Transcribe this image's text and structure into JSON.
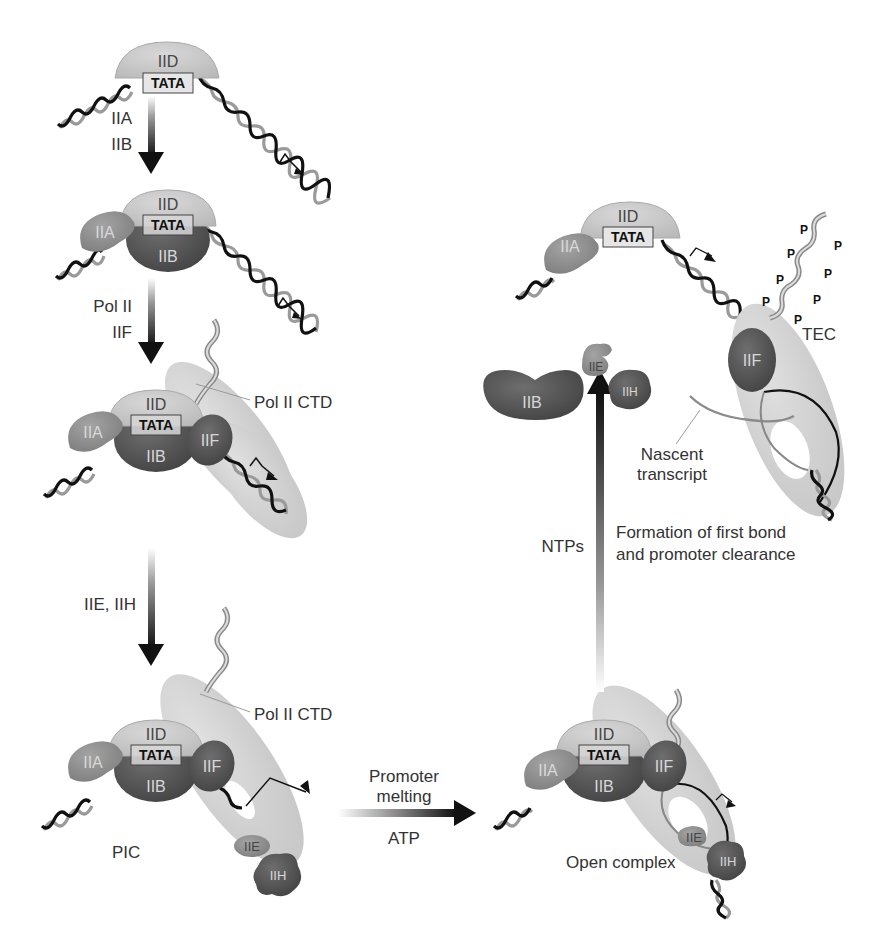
{
  "colors": {
    "iid": "#c9c9c9",
    "iia": "#8f8f8f",
    "iib": "#5a5a5a",
    "iif": "#5e5e5e",
    "iie": "#a8a8a8",
    "iih": "#555555",
    "polII": "#d4d4d4",
    "arrow": "#1a1a1a"
  },
  "factors": {
    "iid": "IID",
    "iia": "IIA",
    "iib": "IIB",
    "iif": "IIF",
    "iie": "IIE",
    "iih": "IIH",
    "tata": "TATA"
  },
  "steps": [
    {
      "id": "tfiid-bound",
      "arrow_labels": [
        "IIA",
        "IIB"
      ]
    },
    {
      "id": "iia-iib-bound",
      "arrow_labels": [
        "Pol II",
        "IIF"
      ]
    },
    {
      "id": "pol-ii-recruited",
      "arrow_labels": [
        "IIE, IIH"
      ],
      "callout": "Pol II CTD"
    },
    {
      "id": "pic",
      "label": "PIC",
      "callout": "Pol II CTD"
    },
    {
      "id": "open-complex",
      "label": "Open complex"
    },
    {
      "id": "tec",
      "label": "TEC",
      "callout": "Nascent transcript",
      "phospho": "P"
    }
  ],
  "transitions": {
    "pic_to_open": {
      "above": [
        "Promoter",
        "melting"
      ],
      "below": "ATP"
    },
    "open_to_tec": {
      "left": "NTPs",
      "right": [
        "Formation of first bond",
        "and promoter clearance"
      ]
    }
  },
  "nascent": [
    "Nascent",
    "transcript"
  ]
}
